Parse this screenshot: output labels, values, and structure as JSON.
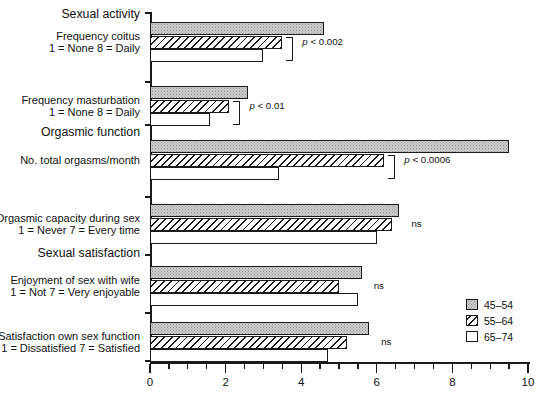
{
  "chart_data": {
    "type": "bar",
    "orientation": "horizontal",
    "title": "",
    "xlabel": "",
    "ylabel": "",
    "xlim": [
      0,
      10
    ],
    "xticks": [
      0,
      2,
      4,
      6,
      8,
      10
    ],
    "xtick_labels": [
      "0",
      "2",
      "4",
      "6",
      "8",
      "10"
    ],
    "xtick_minor_step": 0.5,
    "grid": false,
    "legend_position": "right-bottom",
    "legend": [
      {
        "name": "45-54",
        "label": "45–54",
        "fill": "stipple-gray",
        "color": "#cfcfcf"
      },
      {
        "name": "55-64",
        "label": "55–64",
        "fill": "diagonal-hatch",
        "color": "#ffffff"
      },
      {
        "name": "65-74",
        "label": "65–74",
        "fill": "solid-white",
        "color": "#ffffff"
      }
    ],
    "sections": [
      {
        "label": "Sexual activity"
      },
      {
        "label": "Orgasmic function"
      },
      {
        "label": "Sexual satisfaction"
      }
    ],
    "categories": [
      {
        "line1": "Frequency coitus",
        "line2": "1 = None  8 = Daily",
        "significance": "p < 0.002",
        "has_bracket": true
      },
      {
        "line1": "Frequency masturbation",
        "line2": "1 = None  8 = Daily",
        "significance": "p < 0.01",
        "has_bracket": true
      },
      {
        "line1": "No. total orgasms/month",
        "line2": "",
        "significance": "p < 0.0006",
        "has_bracket": true
      },
      {
        "line1": "Orgasmic capacity during sex",
        "line2": "1 = Never  7 = Every time",
        "significance": "ns",
        "has_bracket": false
      },
      {
        "line1": "Enjoyment of sex with wife",
        "line2": "1 = Not  7 = Very enjoyable",
        "significance": "ns",
        "has_bracket": false
      },
      {
        "line1": "Satisfaction own sex function",
        "line2": "1 = Dissatisfied  7 = Satisfied",
        "significance": "ns",
        "has_bracket": false
      }
    ],
    "series": [
      {
        "name": "45-54",
        "values": [
          4.6,
          2.6,
          9.5,
          6.6,
          5.6,
          5.8
        ]
      },
      {
        "name": "55-64",
        "values": [
          3.5,
          2.1,
          6.2,
          6.4,
          5.0,
          5.2
        ]
      },
      {
        "name": "65-74",
        "values": [
          3.0,
          1.6,
          3.4,
          6.0,
          5.5,
          4.7
        ]
      }
    ]
  }
}
